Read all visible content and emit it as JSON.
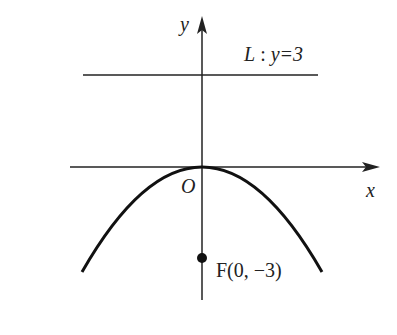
{
  "diagram": {
    "type": "parabola-with-directrix",
    "axes": {
      "x_label": "x",
      "y_label": "y",
      "origin_label": "O"
    },
    "directrix": {
      "label_name": "L",
      "label_sep": " : ",
      "label_eq": "y=3",
      "equation": "y = 3"
    },
    "focus": {
      "label": "F(0, −3)",
      "x": 0,
      "y": -3
    },
    "parabola": {
      "equation": "x^2 = -12y",
      "opens": "down",
      "vertex": [
        0,
        0
      ]
    },
    "colors": {
      "stroke": "#222222",
      "background": "#ffffff"
    }
  }
}
